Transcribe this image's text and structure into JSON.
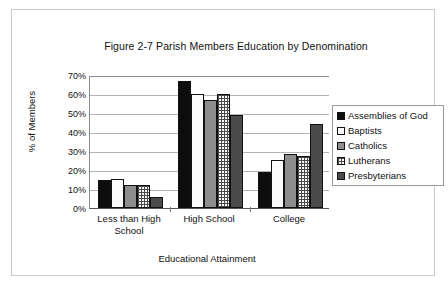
{
  "chart_data": {
    "type": "bar",
    "title": "Figure 2-7 Parish Members Education by Denomination",
    "xlabel": "Educational Attainment",
    "ylabel": "% of Members",
    "categories": [
      "Less than High School",
      "High School",
      "College"
    ],
    "ylim": [
      0,
      70
    ],
    "ytick_labels": [
      "0%",
      "10%",
      "20%",
      "30%",
      "40%",
      "50%",
      "60%",
      "70%"
    ],
    "ytick_values": [
      0,
      10,
      20,
      30,
      40,
      50,
      60,
      70
    ],
    "grid": true,
    "legend_position": "right",
    "series": [
      {
        "name": "Assemblies of God",
        "pattern": "solid-black",
        "color": "#0d0d0d",
        "values": [
          14.5,
          67,
          19
        ]
      },
      {
        "name": "Baptists",
        "pattern": "white-dots",
        "color": "#fbfbfb",
        "values": [
          15.5,
          60,
          25.5
        ]
      },
      {
        "name": "Catholics",
        "pattern": "solid-gray",
        "color": "#8d8d8d",
        "values": [
          12,
          57,
          28.5
        ]
      },
      {
        "name": "Lutherans",
        "pattern": "crosshatch-grid",
        "color": "#fafafa",
        "values": [
          12,
          60,
          27.5
        ]
      },
      {
        "name": "Presbyterians",
        "pattern": "dark-texture",
        "color": "#4b4b4b",
        "values": [
          6,
          49,
          44
        ]
      }
    ]
  },
  "legend": {
    "items": [
      {
        "label": "Assemblies of God"
      },
      {
        "label": "Baptists"
      },
      {
        "label": "Catholics"
      },
      {
        "label": "Lutherans"
      },
      {
        "label": "Presbyterians"
      }
    ]
  },
  "axis": {
    "x_category_labels": [
      "Less than High School",
      "High School",
      "College"
    ]
  }
}
